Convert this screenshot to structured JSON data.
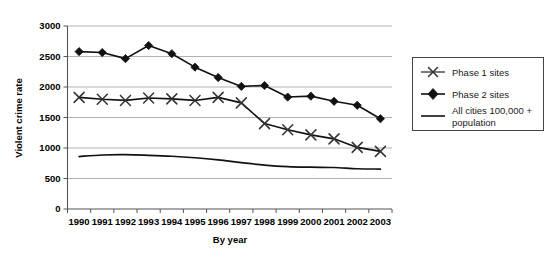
{
  "chart_data": {
    "type": "line",
    "title": "",
    "xlabel": "By year",
    "ylabel": "Violent crime rate",
    "categories": [
      "1990",
      "1991",
      "1992",
      "1993",
      "1994",
      "1995",
      "1996",
      "1997",
      "1998",
      "1999",
      "2000",
      "2001",
      "2002",
      "2003"
    ],
    "ylim": [
      0,
      3000
    ],
    "yticks": [
      0,
      500,
      1000,
      1500,
      2000,
      2500,
      3000
    ],
    "ytick_labels": [
      "0",
      "500",
      "1000",
      "1500",
      "2000",
      "2500",
      "3000"
    ],
    "grid": "horizontal",
    "legend_position": "right-outside",
    "series": [
      {
        "name": "Phase 1 sites",
        "marker": "x",
        "color": "#333333",
        "values": [
          1830,
          1800,
          1780,
          1820,
          1805,
          1780,
          1830,
          1740,
          1400,
          1300,
          1215,
          1150,
          1010,
          945
        ]
      },
      {
        "name": "Phase 2 sites",
        "marker": "diamond",
        "color": "#111111",
        "values": [
          2580,
          2565,
          2465,
          2680,
          2545,
          2325,
          2155,
          2010,
          2025,
          1835,
          1850,
          1765,
          1700,
          1480
        ]
      },
      {
        "name": "All cities 100,000 + population",
        "marker": "none",
        "color": "#111111",
        "smooth": true,
        "values": [
          860,
          885,
          890,
          880,
          865,
          840,
          805,
          760,
          720,
          695,
          685,
          680,
          660,
          655
        ]
      }
    ]
  },
  "legend": {
    "entries": [
      {
        "label": "Phase 1 sites",
        "marker": "x-marker-icon"
      },
      {
        "label": "Phase 2 sites",
        "marker": "diamond-marker-icon"
      },
      {
        "label_line1": "All cities 100,000 +",
        "label_line2": "population",
        "marker": "line-marker-icon"
      }
    ]
  },
  "axes": {
    "y_title": "Violent crime rate",
    "x_title": "By year"
  }
}
